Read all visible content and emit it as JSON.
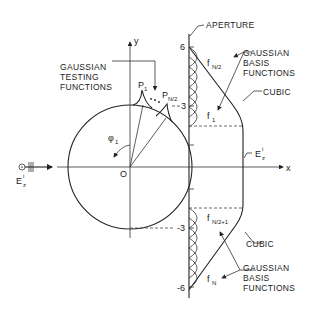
{
  "figure": {
    "labels": {
      "aperture": "APERTURE",
      "gaussian_testing": [
        "GAUSSIAN",
        "TESTING",
        "FUNCTIONS"
      ],
      "gaussian_basis_top": [
        "GAUSSIAN",
        "BASIS",
        "FUNCTIONS"
      ],
      "gaussian_basis_bottom": [
        "GAUSSIAN",
        "BASIS",
        "FUNCTIONS"
      ],
      "cubic_top": "CUBIC",
      "cubic_bottom": "CUBIC",
      "incident_field": "E",
      "incident_field_sub": "z",
      "incident_field_sup": "i",
      "aperture_field": "E",
      "aperture_field_sub": "z",
      "aperture_field_sup": "i",
      "origin": "O",
      "x_axis": "x",
      "y_axis": "y",
      "angle": "φ",
      "angle_sub": "1",
      "p1": "P",
      "p1_sub": "1",
      "pn2": "P",
      "pn2_sub": "N/2",
      "f_n2": "f",
      "f_n2_sub": "N/2",
      "f_1": "f",
      "f_1_sub": "1",
      "f_n2p1": "f",
      "f_n2p1_sub": "N/2+1",
      "f_n": "f",
      "f_n_sub": "N"
    },
    "aperture_ticks": {
      "t6": "6",
      "t3": "3",
      "tm3": "-3",
      "tm6": "-6"
    }
  }
}
